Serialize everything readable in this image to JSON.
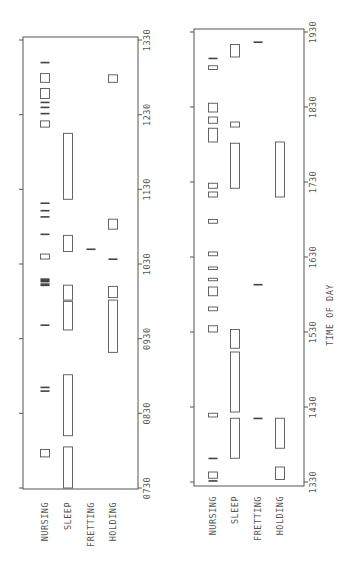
{
  "chart_data": {
    "type": "timeline",
    "orientation": "rotated",
    "xlabel": "TIME OF DAY",
    "categories": [
      "NURSING",
      "SLEEP",
      "FRETTING",
      "HOLDING"
    ],
    "panels": [
      {
        "name": "morning",
        "range": [
          "07:30",
          "13:30"
        ],
        "ticks": [
          "0730",
          "0830",
          "0930",
          "1030",
          "1130",
          "1230",
          "1330"
        ],
        "events": {
          "NURSING": [
            [
              "07:55",
              "08:01"
            ],
            [
              "08:46",
              "08:48"
            ],
            [
              "08:49",
              "08:51"
            ],
            [
              "09:40",
              "09:41"
            ],
            [
              "10:12",
              "10:13"
            ],
            [
              "10:13",
              "10:14"
            ],
            [
              "10:15",
              "10:16"
            ],
            [
              "10:16",
              "10:17"
            ],
            [
              "10:17",
              "10:18"
            ],
            [
              "10:34",
              "10:38"
            ],
            [
              "10:53",
              "10:54"
            ],
            [
              "11:07",
              "11:08"
            ],
            [
              "11:12",
              "11:13"
            ],
            [
              "11:18",
              "11:19"
            ],
            [
              "12:20",
              "12:25"
            ],
            [
              "12:30",
              "12:31"
            ],
            [
              "12:35",
              "12:36"
            ],
            [
              "12:39",
              "12:40"
            ],
            [
              "12:43",
              "12:51"
            ],
            [
              "12:56",
              "13:03"
            ],
            [
              "13:11",
              "13:12"
            ]
          ],
          "SLEEP": [
            [
              "07:30",
              "08:03"
            ],
            [
              "08:12",
              "09:01"
            ],
            [
              "09:37",
              "10:00"
            ],
            [
              "10:01",
              "10:13"
            ],
            [
              "10:40",
              "10:53"
            ],
            [
              "11:22",
              "12:15"
            ]
          ],
          "FRETTING": [
            [
              "10:41",
              "10:42"
            ]
          ],
          "HOLDING": [
            [
              "09:19",
              "10:01"
            ],
            [
              "10:03",
              "10:12"
            ],
            [
              "10:33",
              "10:34"
            ],
            [
              "10:58",
              "11:06"
            ],
            [
              "12:56",
              "13:02"
            ]
          ]
        }
      },
      {
        "name": "afternoon",
        "range": [
          "13:30",
          "19:30"
        ],
        "ticks": [
          "1330",
          "1430",
          "1530",
          "1630",
          "1730",
          "1830",
          "1930"
        ],
        "events": {
          "NURSING": [
            [
              "13:30",
              "13:31"
            ],
            [
              "13:33",
              "13:38"
            ],
            [
              "13:48",
              "13:49"
            ],
            [
              "14:22",
              "14:25"
            ],
            [
              "15:30",
              "15:35"
            ],
            [
              "15:47",
              "15:50"
            ],
            [
              "15:59",
              "16:06"
            ],
            [
              "16:11",
              "16:13"
            ],
            [
              "16:20",
              "16:22"
            ],
            [
              "16:31",
              "16:34"
            ],
            [
              "16:57",
              "17:00"
            ],
            [
              "17:18",
              "17:22"
            ],
            [
              "17:25",
              "17:29"
            ],
            [
              "18:02",
              "18:13"
            ],
            [
              "18:17",
              "18:22"
            ],
            [
              "18:26",
              "18:33"
            ],
            [
              "19:00",
              "19:03"
            ],
            [
              "19:08",
              "19:09"
            ]
          ],
          "SLEEP": [
            [
              "13:49",
              "14:21"
            ],
            [
              "14:26",
              "15:14"
            ],
            [
              "15:17",
              "15:32"
            ],
            [
              "17:25",
              "18:01"
            ],
            [
              "18:14",
              "18:18"
            ],
            [
              "19:10",
              "19:20"
            ]
          ],
          "FRETTING": [
            [
              "14:20",
              "14:21"
            ],
            [
              "16:07",
              "16:08"
            ],
            [
              "19:21",
              "19:22"
            ]
          ],
          "HOLDING": [
            [
              "13:32",
              "13:42"
            ],
            [
              "13:57",
              "14:21"
            ],
            [
              "17:18",
              "18:02"
            ]
          ]
        }
      }
    ]
  }
}
